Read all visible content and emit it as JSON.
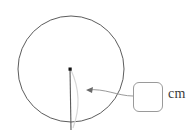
{
  "figure": {
    "kind": "circle-radius-diagram",
    "background_color": "#ffffff"
  },
  "shapes": {
    "circle": {
      "name": "circle-outline",
      "center_x": 71,
      "center_y": 69,
      "radius": 53,
      "stroke_color": "#4a4a4a",
      "stroke_width": 0.9,
      "fill": "none"
    },
    "center_point": {
      "name": "circle-center-dot",
      "x": 70,
      "y": 69,
      "size": 3.2,
      "color": "#111111"
    },
    "radius_segment": {
      "name": "radius-line",
      "x1": 70,
      "y1": 69,
      "x2": 71,
      "y2": 130,
      "stroke_color": "#5a5a5a",
      "stroke_width": 1.1
    },
    "faint_arc": {
      "name": "radius-sweep-arc",
      "path": "M 71 70 Q 84 98 73 128",
      "stroke_color": "#d8d8d8",
      "stroke_width": 1.2
    },
    "leader_line": {
      "name": "callout-leader-line",
      "path": "M 133 96 C 118 96 104 88 88 90",
      "stroke_color": "#8e8e8e",
      "stroke_width": 0.9
    },
    "arrow_head": {
      "name": "callout-arrowhead",
      "points": "86,90 93,87 92,93",
      "color": "#6a6a6a"
    }
  },
  "input": {
    "name": "radius-answer-input",
    "value": "",
    "placeholder": "",
    "border_color": "#9a9a9a",
    "corner_radius_px": 6
  },
  "labels": {
    "unit": "cm"
  }
}
